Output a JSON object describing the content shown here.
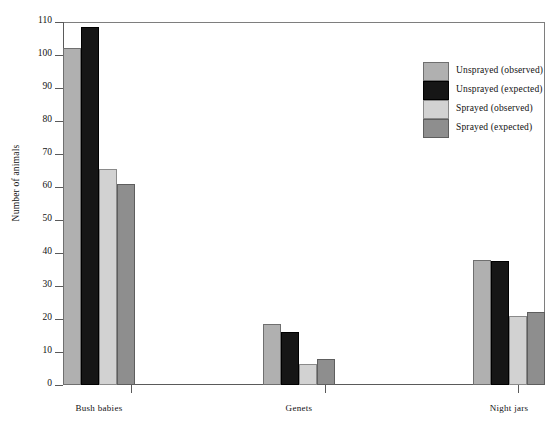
{
  "chart_data": {
    "type": "bar",
    "title": "",
    "xlabel": "",
    "ylabel": "Number of animals",
    "ylim": [
      0,
      110
    ],
    "ytick_step": 10,
    "yticks": [
      0,
      10,
      20,
      30,
      40,
      50,
      60,
      70,
      80,
      90,
      100,
      110
    ],
    "grid": false,
    "legend_position": "top-right",
    "categories": [
      "Bush babies",
      "Genets",
      "Night jars"
    ],
    "series": [
      {
        "name": "Unsprayed (observed)",
        "color": "#b0b0b0",
        "values": [
          102,
          18.5,
          38
        ]
      },
      {
        "name": "Unsprayed (expected)",
        "color": "#161616",
        "values": [
          108.5,
          16,
          37.5
        ]
      },
      {
        "name": "Sprayed (observed)",
        "color": "#d2d2d2",
        "values": [
          65.5,
          6.5,
          21
        ]
      },
      {
        "name": "Sprayed (expected)",
        "color": "#8e8e8e",
        "values": [
          61,
          8,
          22
        ]
      }
    ]
  },
  "axes": {
    "y_title": "Number of animals",
    "y_tick_labels": [
      "0",
      "10",
      "20",
      "30",
      "40",
      "50",
      "60",
      "70",
      "80",
      "90",
      "100",
      "110"
    ],
    "x_tick_labels": [
      "Bush babies",
      "Genets",
      "Night jars"
    ]
  },
  "legend": {
    "entries": [
      {
        "label": "Unsprayed (observed)",
        "swatch": "#b0b0b0"
      },
      {
        "label": "Unsprayed (expected)",
        "swatch": "#161616"
      },
      {
        "label": "Sprayed (observed)",
        "swatch": "#d2d2d2"
      },
      {
        "label": "Sprayed  (expected)",
        "swatch": "#8e8e8e"
      }
    ]
  }
}
